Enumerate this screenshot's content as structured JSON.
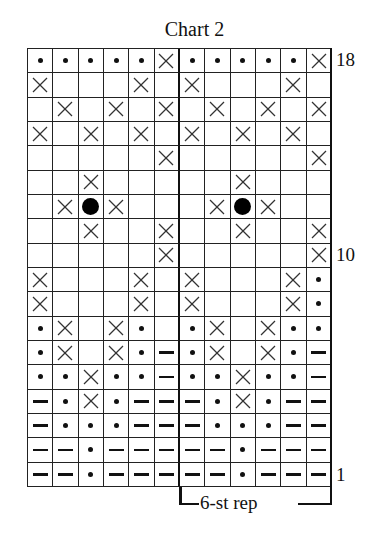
{
  "title": "Chart 2",
  "row_labels": [
    {
      "label": "18",
      "row": 18
    },
    {
      "label": "10",
      "row": 10
    },
    {
      "label": "1",
      "row": 1
    }
  ],
  "repeat_label": "6-st rep",
  "legend_symbols": {
    "dot": "small-dot",
    "x": "cross",
    "dash": "dash",
    "B": "bobble-large-dot",
    "_": "blank"
  },
  "chart_data": {
    "type": "table",
    "title": "Chart 2",
    "columns": 12,
    "rows_count": 18,
    "repeat": {
      "label": "6-st rep",
      "columns": [
        7,
        12
      ]
    },
    "rows_top_to_bottom": [
      {
        "row": 18,
        "cells": [
          "dot",
          "dot",
          "dot",
          "dot",
          "dot",
          "x",
          "dot",
          "dot",
          "dot",
          "dot",
          "dot",
          "x"
        ]
      },
      {
        "row": 17,
        "cells": [
          "x",
          "_",
          "_",
          "_",
          "x",
          "_",
          "x",
          "_",
          "_",
          "_",
          "x",
          "_"
        ]
      },
      {
        "row": 16,
        "cells": [
          "_",
          "x",
          "_",
          "x",
          "_",
          "x",
          "_",
          "x",
          "_",
          "x",
          "_",
          "x"
        ]
      },
      {
        "row": 15,
        "cells": [
          "x",
          "_",
          "x",
          "_",
          "x",
          "_",
          "x",
          "_",
          "x",
          "_",
          "x",
          "_"
        ]
      },
      {
        "row": 14,
        "cells": [
          "_",
          "_",
          "_",
          "_",
          "_",
          "x",
          "_",
          "_",
          "_",
          "_",
          "_",
          "x"
        ]
      },
      {
        "row": 13,
        "cells": [
          "_",
          "_",
          "x",
          "_",
          "_",
          "_",
          "_",
          "_",
          "x",
          "_",
          "_",
          "_"
        ]
      },
      {
        "row": 12,
        "cells": [
          "_",
          "x",
          "B",
          "x",
          "_",
          "_",
          "_",
          "x",
          "B",
          "x",
          "_",
          "_"
        ]
      },
      {
        "row": 11,
        "cells": [
          "_",
          "_",
          "x",
          "_",
          "_",
          "x",
          "_",
          "_",
          "x",
          "_",
          "_",
          "x"
        ]
      },
      {
        "row": 10,
        "cells": [
          "_",
          "_",
          "_",
          "_",
          "_",
          "x",
          "_",
          "_",
          "_",
          "_",
          "_",
          "x"
        ]
      },
      {
        "row": 9,
        "cells": [
          "x",
          "_",
          "_",
          "_",
          "x",
          "_",
          "x",
          "_",
          "_",
          "_",
          "x",
          "dot"
        ]
      },
      {
        "row": 8,
        "cells": [
          "x",
          "_",
          "_",
          "_",
          "x",
          "_",
          "x",
          "_",
          "_",
          "_",
          "x",
          "dot"
        ]
      },
      {
        "row": 7,
        "cells": [
          "dot",
          "x",
          "_",
          "x",
          "dot",
          "_",
          "dot",
          "x",
          "_",
          "x",
          "dot",
          "dot"
        ]
      },
      {
        "row": 6,
        "cells": [
          "dot",
          "x",
          "_",
          "x",
          "dot",
          "dash",
          "dot",
          "x",
          "_",
          "x",
          "dot",
          "dash"
        ]
      },
      {
        "row": 5,
        "cells": [
          "dot",
          "dot",
          "x",
          "dot",
          "dot",
          "dash",
          "dot",
          "dot",
          "x",
          "dot",
          "dot",
          "dash"
        ]
      },
      {
        "row": 4,
        "cells": [
          "dash",
          "dot",
          "x",
          "dot",
          "dash",
          "dash",
          "dash",
          "dot",
          "x",
          "dot",
          "dash",
          "dash"
        ]
      },
      {
        "row": 3,
        "cells": [
          "dash",
          "dot",
          "dot",
          "dot",
          "dash",
          "dash",
          "dash",
          "dot",
          "dot",
          "dot",
          "dash",
          "dash"
        ]
      },
      {
        "row": 2,
        "cells": [
          "dash",
          "dash",
          "dot",
          "dash",
          "dash",
          "dash",
          "dash",
          "dash",
          "dot",
          "dash",
          "dash",
          "dash"
        ]
      },
      {
        "row": 1,
        "cells": [
          "dash",
          "dash",
          "dot",
          "dash",
          "dash",
          "dash",
          "dash",
          "dash",
          "dot",
          "dash",
          "dash",
          "dash"
        ]
      }
    ]
  }
}
